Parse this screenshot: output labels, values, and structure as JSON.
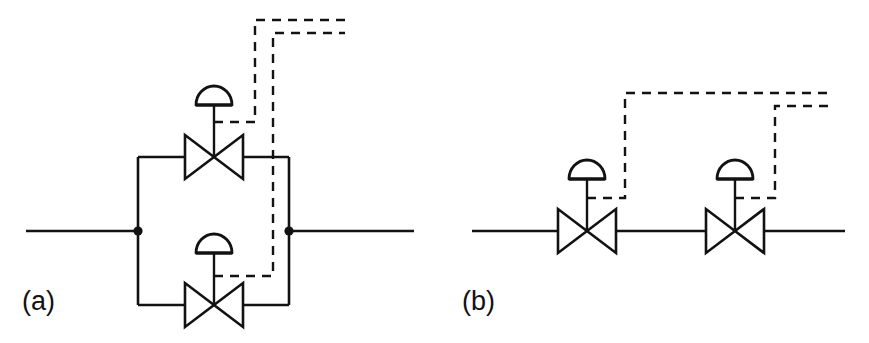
{
  "figure": {
    "background_color": "#ffffff",
    "line_color": "#121212",
    "width": 869,
    "height": 343
  },
  "panels": [
    {
      "id": "a",
      "label": "(a)",
      "name": "parallel-bypass-configuration",
      "description": "Two diaphragm-actuated control valves arranged in parallel branches around the main process line",
      "valve_count": 2,
      "signal_line_count": 2,
      "junction_count": 2,
      "valves": [
        {
          "name": "upper-control-valve",
          "position": "top-branch",
          "type": "globe-valve",
          "actuator": "diaphragm",
          "actuator_label": ""
        },
        {
          "name": "lower-control-valve",
          "position": "bottom-branch",
          "type": "globe-valve",
          "actuator": "diaphragm",
          "actuator_label": ""
        }
      ]
    },
    {
      "id": "b",
      "label": "(b)",
      "name": "series-inline-configuration",
      "description": "Two diaphragm-actuated control valves arranged in series on a single process line",
      "valve_count": 2,
      "signal_line_count": 2,
      "junction_count": 0,
      "valves": [
        {
          "name": "left-control-valve",
          "position": "upstream",
          "type": "globe-valve",
          "actuator": "diaphragm",
          "actuator_label": ""
        },
        {
          "name": "right-control-valve",
          "position": "downstream",
          "type": "globe-valve",
          "actuator": "diaphragm",
          "actuator_label": ""
        }
      ]
    }
  ],
  "legend": {
    "process_line_style": "solid",
    "signal_line_style": "dashed"
  }
}
